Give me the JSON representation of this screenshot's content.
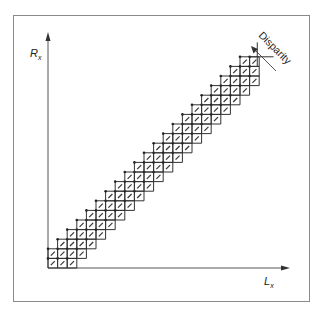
{
  "figure": {
    "axes": {
      "y_label": "R",
      "y_label_sub": "x",
      "x_label": "L",
      "x_label_sub": "x"
    },
    "annotation": {
      "text": "Disparity",
      "arrow_direction": "up-left"
    },
    "lattice": {
      "description": "Diagonal band of matching grid cells along the Lx = Rx diagonal",
      "cell_size_px": 9.6,
      "band_width_cells": 4,
      "cells_along_diagonal": 22
    },
    "colors": {
      "line": "#333333",
      "frame": "#888888",
      "background": "#ffffff"
    }
  }
}
